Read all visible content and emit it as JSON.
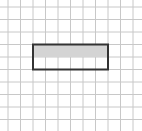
{
  "diagram": {
    "type": "grid-with-rectangle",
    "grid": {
      "columns": 10,
      "rows": 9,
      "origin_x": 8,
      "origin_y": 7,
      "cell_size": 12.5,
      "line_color": "#c8c8c8"
    },
    "rectangle": {
      "col_start": 2,
      "row_start": 3,
      "width_cells": 6,
      "height_cells": 2,
      "border_color": "#333333",
      "shaded_rows": 1,
      "shade_color": "#d4d4d4"
    }
  }
}
